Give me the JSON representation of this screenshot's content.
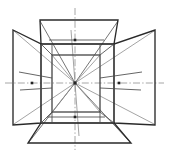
{
  "figure": {
    "title": "Unfolded box perspective projection diagram",
    "background_color": "#ffffff",
    "line_color_heavy": "#2a2a2a",
    "line_color_light": "#4a4a4a",
    "ray_color": "#8d8d8d",
    "center_line_color": "#909090",
    "marker_color": "#242424"
  },
  "geometry": {
    "canvas": {
      "width": 169,
      "height": 156
    },
    "vanishing_point": {
      "x": 75,
      "y": 83,
      "label": "centre vanishing point"
    },
    "inner_rect": {
      "label": "central back face",
      "left": 52,
      "right": 100,
      "top": 55,
      "bottom": 112
    },
    "outer_rect": {
      "label": "front opening face",
      "left": 41,
      "right": 114,
      "top": 44,
      "bottom": 123
    },
    "faces": [
      {
        "name": "top-face",
        "label": "Top trapezoid",
        "points": "40,20 118,20 114,44 41,44"
      },
      {
        "name": "bottom-face",
        "label": "Bottom trapezoid",
        "points": "41,123 114,123 131,143 28,143"
      },
      {
        "name": "left-face",
        "label": "Left trapezoid",
        "points": "13,30 41,44 41,123 13,125"
      },
      {
        "name": "right-face",
        "label": "Right trapezoid",
        "points": "155,30 155,125 114,123 114,44"
      }
    ],
    "markers": [
      {
        "name": "top-marker",
        "x": 75,
        "y": 40,
        "size": 2.6
      },
      {
        "name": "bottom-marker",
        "x": 75,
        "y": 117,
        "size": 2.6
      },
      {
        "name": "left-marker",
        "x": 32,
        "y": 83,
        "size": 2.6
      },
      {
        "name": "right-marker",
        "x": 119,
        "y": 83,
        "size": 2.6
      }
    ],
    "center_lines": [
      {
        "name": "vertical-centre-line",
        "x1": 75,
        "y1": 8,
        "x2": 75,
        "y2": 150
      },
      {
        "name": "horizontal-centre-line",
        "x1": 5,
        "y1": 83,
        "x2": 164,
        "y2": 83
      }
    ],
    "rays": [
      {
        "name": "ray-to-top-left-outer",
        "x2": 40,
        "y2": 20
      },
      {
        "name": "ray-to-top-right-outer",
        "x2": 118,
        "y2": 20
      },
      {
        "name": "ray-to-bottom-left-outer",
        "x2": 28,
        "y2": 143
      },
      {
        "name": "ray-to-bottom-right-outer",
        "x2": 131,
        "y2": 143
      },
      {
        "name": "ray-to-left-top",
        "x2": 13,
        "y2": 30
      },
      {
        "name": "ray-to-left-bottom",
        "x2": 13,
        "y2": 125
      },
      {
        "name": "ray-to-right-top",
        "x2": 155,
        "y2": 30
      },
      {
        "name": "ray-to-right-bottom",
        "x2": 155,
        "y2": 125
      },
      {
        "name": "ray-to-inner-top-left",
        "x2": 52,
        "y2": 55
      },
      {
        "name": "ray-to-inner-top-right",
        "x2": 100,
        "y2": 55
      },
      {
        "name": "ray-to-inner-bottom-left",
        "x2": 52,
        "y2": 112
      },
      {
        "name": "ray-to-inner-bottom-right",
        "x2": 100,
        "y2": 112
      }
    ]
  }
}
